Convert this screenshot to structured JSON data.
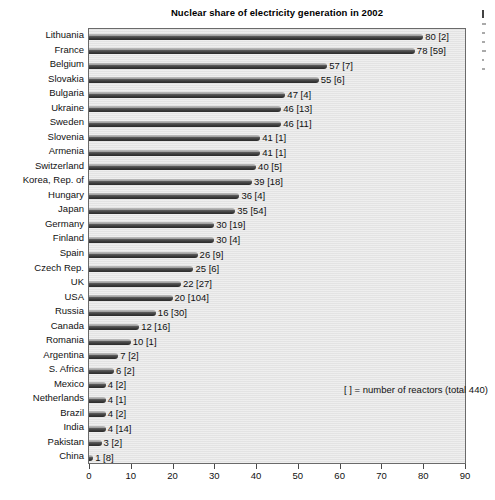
{
  "chart_data": {
    "type": "bar",
    "orientation": "horizontal",
    "title": "Nuclear share of electricity generation in 2002",
    "xlabel": "",
    "ylabel": "",
    "xlim": [
      0,
      90
    ],
    "xticks": [
      0,
      10,
      20,
      30,
      40,
      50,
      60,
      70,
      80,
      90
    ],
    "grid": false,
    "legend": null,
    "annotation": "[  ] = number of reactors (total 440)",
    "value_label_format": "{value}  [{reactors}]",
    "categories": [
      "Lithuania",
      "France",
      "Belgium",
      "Slovakia",
      "Bulgaria",
      "Ukraine",
      "Sweden",
      "Slovenia",
      "Armenia",
      "Switzerland",
      "Korea, Rep. of",
      "Hungary",
      "Japan",
      "Germany",
      "Finland",
      "Spain",
      "Czech Rep.",
      "UK",
      "USA",
      "Russia",
      "Canada",
      "Romania",
      "Argentina",
      "S. Africa",
      "Mexico",
      "Netherlands",
      "Brazil",
      "India",
      "Pakistan",
      "China"
    ],
    "values": [
      80,
      78,
      57,
      55,
      47,
      46,
      46,
      41,
      41,
      40,
      39,
      36,
      35,
      30,
      30,
      26,
      25,
      22,
      20,
      16,
      12,
      10,
      7,
      6,
      4,
      4,
      4,
      4,
      3,
      1
    ],
    "reactors": [
      2,
      59,
      7,
      6,
      4,
      13,
      11,
      1,
      1,
      5,
      18,
      4,
      54,
      19,
      4,
      9,
      6,
      27,
      104,
      30,
      16,
      1,
      2,
      2,
      2,
      1,
      2,
      14,
      2,
      8
    ],
    "value_labels": [
      "80  [2]",
      "78  [59]",
      "57  [7]",
      "55  [6]",
      "47  [4]",
      "46  [13]",
      "46  [11]",
      "41  [1]",
      "41  [1]",
      "40  [5]",
      "39  [18]",
      "36  [4]",
      "35  [54]",
      "30  [19]",
      "30  [4]",
      "26  [9]",
      "25  [6]",
      "22  [27]",
      "20  [104]",
      "16  [30]",
      "12  [16]",
      "10  [1]",
      "7  [2]",
      "6  [2]",
      "4  [2]",
      "4  [1]",
      "4  [2]",
      "4  [14]",
      "3  [2]",
      "1  [8]"
    ],
    "colors": {
      "bar": "#3a3a3a",
      "bar_highlight": "#cfcfcf",
      "plot_background": "#e6e6e6",
      "frame": "#6a6a6a",
      "text": "#111111",
      "page_background": "#ffffff"
    }
  }
}
